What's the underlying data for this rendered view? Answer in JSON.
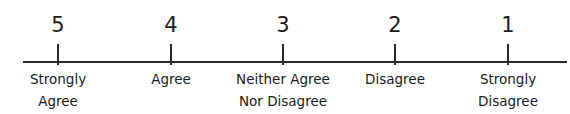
{
  "scale": {
    "title": "",
    "points": [
      {
        "value": "5",
        "label_line1": "Strongly",
        "label_line2": "Agree",
        "x": 58
      },
      {
        "value": "4",
        "label_line1": "Agree",
        "label_line2": "",
        "x": 171
      },
      {
        "value": "3",
        "label_line1": "Neither Agree",
        "label_line2": "Nor Disagree",
        "x": 283
      },
      {
        "value": "2",
        "label_line1": "Disagree",
        "label_line2": "",
        "x": 395
      },
      {
        "value": "1",
        "label_line1": "Strongly",
        "label_line2": "Disagree",
        "x": 508
      }
    ],
    "line_color": "#2a2a2a"
  }
}
